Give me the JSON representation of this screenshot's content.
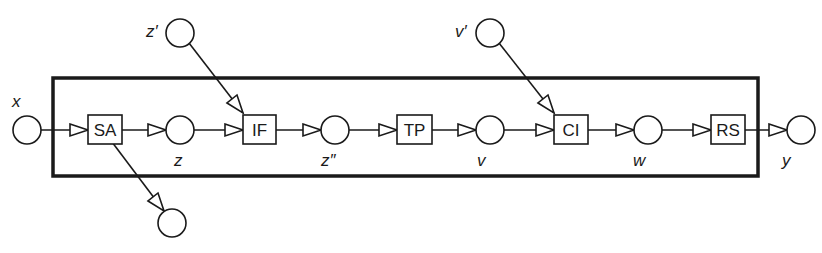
{
  "diagram": {
    "type": "petri-net-pipeline",
    "frame": {
      "x": 52,
      "y": 77,
      "width": 707,
      "height": 100
    },
    "colors": {
      "stroke": "#1a1a1a",
      "fill": "#ffffff"
    },
    "transitions": [
      {
        "id": "SA",
        "label": "SA",
        "x": 88,
        "y": 113,
        "w": 34,
        "h": 29
      },
      {
        "id": "IF",
        "label": "IF",
        "x": 243,
        "y": 113,
        "w": 33,
        "h": 29
      },
      {
        "id": "TP",
        "label": "TP",
        "x": 397,
        "y": 113,
        "w": 35,
        "h": 29
      },
      {
        "id": "CI",
        "label": "CI",
        "x": 554,
        "y": 113,
        "w": 34,
        "h": 29
      },
      {
        "id": "RS",
        "label": "RS",
        "x": 711,
        "y": 113,
        "w": 34,
        "h": 29
      }
    ],
    "places": [
      {
        "id": "x",
        "label": "x",
        "cx": 27,
        "cy": 130,
        "label_x": 14,
        "label_y": 106
      },
      {
        "id": "z",
        "label": "z",
        "cx": 180,
        "cy": 130,
        "label_x": 174,
        "label_y": 166
      },
      {
        "id": "z_prime",
        "label": "z′",
        "cx": 180,
        "cy": 33,
        "label_x": 146,
        "label_y": 36
      },
      {
        "id": "z_dprime",
        "label": "z″",
        "cx": 335,
        "cy": 130,
        "label_x": 321,
        "label_y": 166
      },
      {
        "id": "v",
        "label": "v",
        "cx": 490,
        "cy": 130,
        "label_x": 477,
        "label_y": 166
      },
      {
        "id": "v_prime",
        "label": "v′",
        "cx": 490,
        "cy": 33,
        "label_x": 455,
        "label_y": 36
      },
      {
        "id": "w",
        "label": "w",
        "cx": 648,
        "cy": 130,
        "label_x": 634,
        "label_y": 166
      },
      {
        "id": "y",
        "label": "y",
        "cx": 801,
        "cy": 130,
        "label_x": 782,
        "label_y": 166
      },
      {
        "id": "out",
        "label": "",
        "cx": 172,
        "cy": 223
      }
    ],
    "arcs": [
      {
        "from": "x",
        "to": "SA"
      },
      {
        "from": "SA",
        "to": "z"
      },
      {
        "from": "z",
        "to": "IF"
      },
      {
        "from": "z_prime",
        "to": "IF"
      },
      {
        "from": "IF",
        "to": "z_dprime"
      },
      {
        "from": "z_dprime",
        "to": "TP"
      },
      {
        "from": "TP",
        "to": "v"
      },
      {
        "from": "v",
        "to": "CI"
      },
      {
        "from": "v_prime",
        "to": "CI"
      },
      {
        "from": "CI",
        "to": "w"
      },
      {
        "from": "w",
        "to": "RS"
      },
      {
        "from": "RS",
        "to": "y"
      },
      {
        "from": "SA",
        "to": "out"
      }
    ]
  }
}
